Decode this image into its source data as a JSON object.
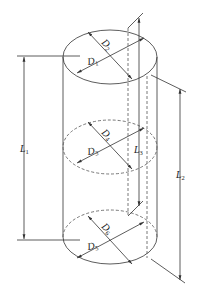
{
  "diagram": {
    "type": "cylinder-dimension-drawing",
    "labels": {
      "D1": {
        "main": "D",
        "sub": "1"
      },
      "D2": {
        "main": "D",
        "sub": "2"
      },
      "D3": {
        "main": "D",
        "sub": "3"
      },
      "D4": {
        "main": "D",
        "sub": "4"
      },
      "D5": {
        "main": "D",
        "sub": "5"
      },
      "D6": {
        "main": "D",
        "sub": "6"
      },
      "L1": {
        "main": "L",
        "sub": "1"
      },
      "L2": {
        "main": "L",
        "sub": "2"
      },
      "L3": {
        "main": "L",
        "sub": "3"
      }
    },
    "colors": {
      "line": "#333333",
      "dashed": "#555555",
      "text": "#222222",
      "background": "#ffffff"
    }
  }
}
